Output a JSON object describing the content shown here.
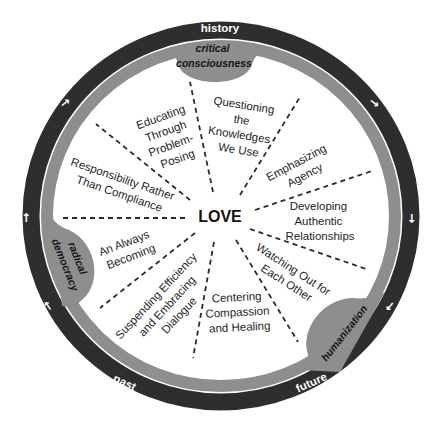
{
  "colors": {
    "outer_ring": "#2e2e2e",
    "inner_ring": "#8e8e8e",
    "node_fill": "#8e8e8e",
    "text": "#1e1e1e",
    "ring_text": "#ffffff",
    "background": "#ffffff"
  },
  "center": {
    "label": "LOVE"
  },
  "outer_ring": {
    "labels": {
      "top": "history",
      "bottom_left": "past",
      "bottom_right": "future"
    },
    "arrows": [
      {
        "icon": "arrow-icon",
        "position": "upper-left",
        "glyph": "↑",
        "direction": "clockwise"
      },
      {
        "icon": "arrow-icon",
        "position": "upper-right",
        "glyph": "↑",
        "direction": "clockwise"
      },
      {
        "icon": "arrow-icon",
        "position": "right",
        "glyph": "↑",
        "direction": "clockwise"
      },
      {
        "icon": "arrow-icon",
        "position": "lower-right",
        "glyph": "↑",
        "direction": "clockwise"
      },
      {
        "icon": "arrow-icon",
        "position": "lower-left",
        "glyph": "↑",
        "direction": "clockwise"
      },
      {
        "icon": "arrow-icon",
        "position": "left",
        "glyph": "↑",
        "direction": "clockwise"
      }
    ]
  },
  "inner_ring_nodes": [
    {
      "id": "critical-consciousness",
      "lines": [
        "critical",
        "consciousness"
      ]
    },
    {
      "id": "radical-democracy",
      "lines": [
        "radical",
        "democracy"
      ]
    },
    {
      "id": "humanization",
      "lines": [
        "humanization"
      ]
    }
  ],
  "sectors": [
    {
      "id": "questioning",
      "lines": [
        "Questioning",
        "the",
        "Knowledges",
        "We Use"
      ]
    },
    {
      "id": "emphasizing",
      "lines": [
        "Emphasizing",
        "Agency"
      ]
    },
    {
      "id": "developing",
      "lines": [
        "Developing",
        "Authentic",
        "Relationships"
      ]
    },
    {
      "id": "watching",
      "lines": [
        "Watching Out for",
        "Each Other"
      ]
    },
    {
      "id": "centering",
      "lines": [
        "Centering",
        "Compassion",
        "and Healing"
      ]
    },
    {
      "id": "suspending",
      "lines": [
        "Suspending Efficiency",
        "and Embracing",
        "Dialogue"
      ]
    },
    {
      "id": "always-becoming",
      "lines": [
        "An Always",
        "Becoming"
      ]
    },
    {
      "id": "responsibility",
      "lines": [
        "Responsibility Rather",
        "Than Compliance"
      ]
    },
    {
      "id": "educating",
      "lines": [
        "Educating",
        "Through",
        "Problem-",
        "Posing"
      ]
    }
  ]
}
